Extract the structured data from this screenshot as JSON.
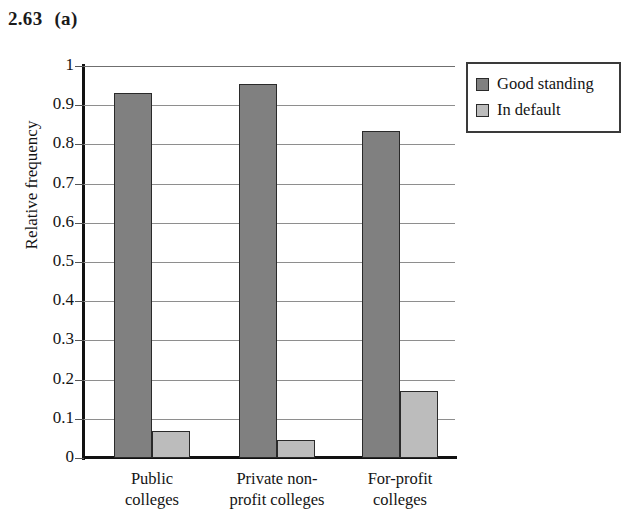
{
  "header": {
    "exercise_number": "2.63",
    "part_label": "(a)"
  },
  "legend": {
    "items": [
      {
        "label": "Good standing",
        "color": "#808080",
        "swatch_name": "legend-swatch-good-standing"
      },
      {
        "label": "In default",
        "color": "#bcbcbc",
        "swatch_name": "legend-swatch-in-default"
      }
    ]
  },
  "axes": {
    "y_title": "Relative frequency",
    "y_ticks": [
      "1",
      "0.9",
      "0.8",
      "0.7",
      "0.6",
      "0.5",
      "0.4",
      "0.3",
      "0.2",
      "0.1",
      "0"
    ],
    "x_categories": [
      {
        "line1": "Public",
        "line2": "colleges"
      },
      {
        "line1": "Private non-",
        "line2": "profit colleges"
      },
      {
        "line1": "For-profit",
        "line2": "colleges"
      }
    ]
  },
  "chart_data": {
    "type": "bar",
    "title": "",
    "xlabel": "",
    "ylabel": "Relative frequency",
    "ylim": [
      0,
      1
    ],
    "ytick_step": 0.1,
    "grid": true,
    "legend_position": "top-right-outside",
    "categories": [
      "Public colleges",
      "Private non-profit colleges",
      "For-profit colleges"
    ],
    "series": [
      {
        "name": "Good standing",
        "color": "#808080",
        "values": [
          0.93,
          0.955,
          0.835
        ]
      },
      {
        "name": "In default",
        "color": "#bcbcbc",
        "values": [
          0.07,
          0.045,
          0.17
        ]
      }
    ]
  }
}
